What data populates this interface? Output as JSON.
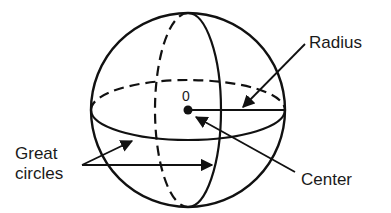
{
  "diagram": {
    "type": "sphere-geometry",
    "labels": {
      "zero": "0",
      "radius": "Radius",
      "center": "Center",
      "great_circles_line1": "Great",
      "great_circles_line2": "circles"
    },
    "colors": {
      "stroke": "#111111",
      "background": "#ffffff",
      "text": "#1a1a1a"
    }
  }
}
